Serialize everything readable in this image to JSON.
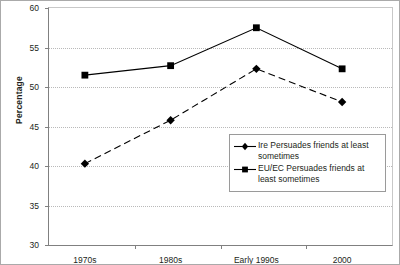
{
  "chart_data": {
    "type": "line",
    "title": "",
    "subtitle": "",
    "xlabel": "",
    "ylabel": "Percentage",
    "categories": [
      "1970s",
      "1980s",
      "Early 1990s",
      "2000"
    ],
    "yticks": [
      30,
      35,
      40,
      45,
      50,
      55,
      60
    ],
    "ylim": [
      30,
      60
    ],
    "grid": "horizontal-dotted",
    "legend_position": "inside-lower-right",
    "series": [
      {
        "name": "Ire Persuades friends at least sometimes",
        "marker": "diamond",
        "line_style": "dashed",
        "color": "#000000",
        "values": [
          40.3,
          45.8,
          52.3,
          48.1
        ]
      },
      {
        "name": "EU/EC Persuades friends at least sometimes",
        "marker": "square",
        "line_style": "solid",
        "color": "#000000",
        "values": [
          51.5,
          52.7,
          57.5,
          52.3
        ]
      }
    ]
  },
  "legend": {
    "entries": [
      {
        "label": "Ire Persuades friends at least sometimes",
        "marker": "diamond-marker-icon"
      },
      {
        "label": "EU/EC Persuades friends at least sometimes",
        "marker": "square-marker-icon"
      }
    ]
  },
  "axes": {
    "y_label_text": "Percentage",
    "y_tick_labels": [
      "60",
      "55",
      "50",
      "45",
      "40",
      "35",
      "30"
    ],
    "x_tick_labels": [
      "1970s",
      "1980s",
      "Early 1990s",
      "2000"
    ]
  }
}
